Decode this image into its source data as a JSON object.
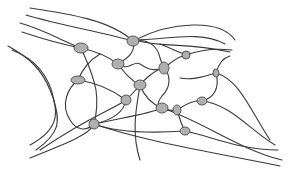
{
  "diagram": {
    "type": "polymer-network",
    "label_cropped": "",
    "colors": {
      "stroke": "#3a3a3a",
      "node_fill": "#b8b8b8",
      "node_dot": "#8e8e8e",
      "background": "#ffffff"
    },
    "nodes": [
      {
        "id": "n1",
        "cx": 81,
        "cy": 48,
        "rx": 7,
        "ry": 5
      },
      {
        "id": "n2",
        "cx": 133,
        "cy": 41,
        "rx": 6,
        "ry": 5
      },
      {
        "id": "n3",
        "cx": 118,
        "cy": 64,
        "rx": 6,
        "ry": 5
      },
      {
        "id": "n4",
        "cx": 164,
        "cy": 68,
        "rx": 5,
        "ry": 6
      },
      {
        "id": "n5",
        "cx": 186,
        "cy": 55,
        "rx": 4,
        "ry": 4
      },
      {
        "id": "n6",
        "cx": 78,
        "cy": 80,
        "rx": 7,
        "ry": 4
      },
      {
        "id": "n7",
        "cx": 140,
        "cy": 85,
        "rx": 6,
        "ry": 5
      },
      {
        "id": "n8",
        "cx": 126,
        "cy": 100,
        "rx": 5,
        "ry": 5
      },
      {
        "id": "n9",
        "cx": 162,
        "cy": 108,
        "rx": 6,
        "ry": 5
      },
      {
        "id": "n10",
        "cx": 216,
        "cy": 73,
        "rx": 3,
        "ry": 4
      },
      {
        "id": "n11",
        "cx": 202,
        "cy": 101,
        "rx": 5,
        "ry": 4
      },
      {
        "id": "n12",
        "cx": 177,
        "cy": 110,
        "rx": 4,
        "ry": 5
      },
      {
        "id": "n13",
        "cx": 94,
        "cy": 124,
        "rx": 5,
        "ry": 5
      },
      {
        "id": "n14",
        "cx": 185,
        "cy": 131,
        "rx": 5,
        "ry": 4
      }
    ],
    "chains": [
      "M30 8 C70 14 110 20 133 41",
      "M26 15 C60 25 100 32 133 41",
      "M20 23 C45 30 60 40 81 48",
      "M22 32 C40 38 60 44 81 48",
      "M8 46 C30 58 42 70 50 90 C58 108 62 128 30 145",
      "M12 50 C38 60 50 80 54 100 C58 118 64 130 36 150",
      "M135 40 C170 22 220 18 235 40",
      "M135 40 C165 40 200 30 225 44",
      "M135 40 C160 48 185 42 230 52",
      "M133 41 C136 52 128 58 118 64",
      "M81 48 C100 52 110 58 118 64",
      "M81 48 C86 60 92 70 96 90 C98 104 96 116 94 124",
      "M133 41 C150 38 158 48 160 58 C162 64 164 66 164 68",
      "M118 64 C128 72 134 60 140 64 C146 68 152 72 164 68",
      "M164 68 C172 62 178 56 186 55",
      "M160 44 C170 48 178 52 186 55",
      "M164 68 C170 74 172 86 162 96 C156 104 158 106 162 108",
      "M140 85 C146 78 150 74 158 70",
      "M118 64 C124 72 130 80 140 85",
      "M78 80 C92 82 110 88 126 100",
      "M78 80 C68 88 60 104 70 120 C76 130 86 132 94 124",
      "M78 80 C82 70 90 60 100 54",
      "M126 100 C132 94 136 90 140 85",
      "M140 85 C144 96 152 104 162 108",
      "M126 100 C124 112 112 120 94 124",
      "M94 124 C110 130 140 134 185 131",
      "M94 124 C120 118 150 114 162 108",
      "M94 124 C90 134 70 142 30 158",
      "M162 108 C168 110 172 112 177 110",
      "M177 110 C186 104 196 100 202 101",
      "M202 101 C214 98 220 88 216 73",
      "M216 73 C218 66 222 58 230 56",
      "M216 73 C240 80 250 110 270 140",
      "M202 101 C230 104 250 130 275 145",
      "M216 73 C200 78 190 80 180 78",
      "M177 110 C180 120 182 126 185 131",
      "M185 131 C210 136 240 150 278 150",
      "M162 108 C200 120 240 150 282 160",
      "M94 124 C140 140 200 150 280 166",
      "M126 100 C112 110 90 116 40 150",
      "M140 85 C138 100 130 130 140 160",
      "M186 55 C200 50 215 48 232 50"
    ]
  }
}
